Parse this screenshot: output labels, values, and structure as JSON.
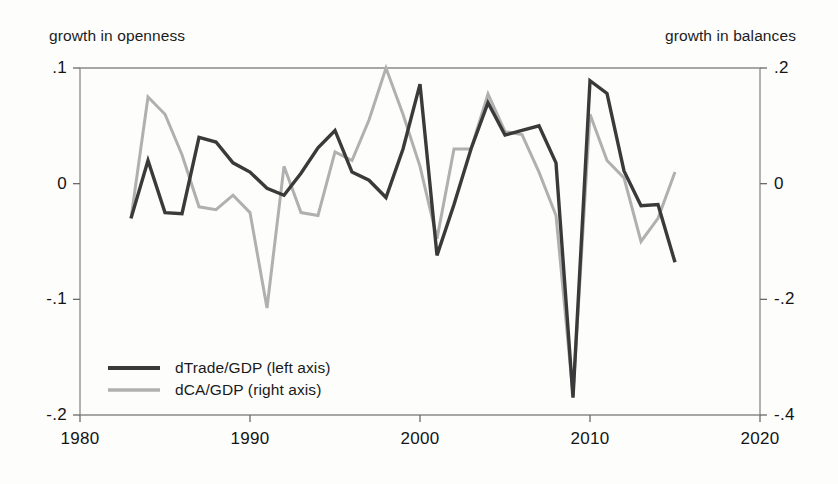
{
  "header": {
    "left_title": "growth in openness",
    "right_title": "growth in balances"
  },
  "legend": {
    "entries": [
      {
        "label": "dTrade/GDP (left axis)",
        "color": "#3a3a3a",
        "axis": "left"
      },
      {
        "label": "dCA/GDP (right axis)",
        "color": "#b0b0b0",
        "axis": "right"
      }
    ]
  },
  "axes": {
    "x_ticks": [
      "1980",
      "1990",
      "2000",
      "2010",
      "2020"
    ],
    "y_left_ticks": [
      ".1",
      "0",
      "-.1",
      "-.2"
    ],
    "y_right_ticks": [
      ".2",
      "0",
      "-.2",
      "-.4"
    ]
  },
  "chart_data": {
    "type": "line",
    "title": "",
    "subtitle": "",
    "xlabel": "",
    "ylabel": "growth in openness",
    "y2label": "growth in balances",
    "grid": false,
    "legend_position": "inside-lower-left",
    "xlim": [
      1980,
      2020
    ],
    "ylim": [
      -0.2,
      0.1
    ],
    "y2lim": [
      -0.4,
      0.2
    ],
    "x_tick_values": [
      1980,
      1990,
      2000,
      2010,
      2020
    ],
    "y_tick_values": [
      0.1,
      0,
      -0.1,
      -0.2
    ],
    "y2_tick_values": [
      0.2,
      0,
      -0.2,
      -0.4
    ],
    "x": [
      1983,
      1984,
      1985,
      1986,
      1987,
      1988,
      1989,
      1990,
      1991,
      1992,
      1993,
      1994,
      1995,
      1996,
      1997,
      1998,
      1999,
      2000,
      2001,
      2002,
      2003,
      2004,
      2005,
      2006,
      2007,
      2008,
      2009,
      2010,
      2011,
      2012,
      2013,
      2014,
      2015
    ],
    "series": [
      {
        "name": "dTrade/GDP (left axis)",
        "axis": "left",
        "color": "#3a3a3a",
        "values": [
          -0.03,
          0.02,
          -0.025,
          -0.026,
          0.04,
          0.036,
          0.018,
          0.01,
          -0.004,
          -0.01,
          0.009,
          0.031,
          0.046,
          0.01,
          0.003,
          -0.012,
          0.03,
          0.086,
          -0.062,
          -0.018,
          0.03,
          0.07,
          0.042,
          0.046,
          0.05,
          0.018,
          -0.185,
          0.089,
          0.078,
          0.011,
          -0.019,
          -0.018,
          -0.068
        ]
      },
      {
        "name": "dCA/GDP (right axis)",
        "axis": "right",
        "color": "#b0b0b0",
        "values": [
          -0.06,
          0.15,
          0.12,
          0.05,
          -0.04,
          -0.045,
          -0.02,
          -0.05,
          -0.215,
          0.03,
          -0.05,
          -0.055,
          0.055,
          0.04,
          0.11,
          0.2,
          0.12,
          0.03,
          -0.095,
          0.06,
          0.06,
          0.155,
          0.09,
          0.085,
          0.02,
          -0.055,
          -0.365,
          0.12,
          0.04,
          0.01,
          -0.1,
          -0.06,
          0.02
        ]
      }
    ]
  },
  "plot_geometry": {
    "left_px": 80,
    "right_px": 760,
    "top_px": 68,
    "bottom_px": 415
  }
}
